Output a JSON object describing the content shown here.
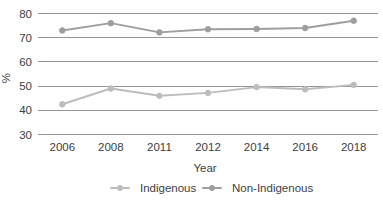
{
  "chart_data": {
    "type": "line",
    "title": "",
    "subtitle": "",
    "xlabel": "Year",
    "ylabel": "%",
    "categories": [
      "2006",
      "2008",
      "2011",
      "2012",
      "2014",
      "2016",
      "2018"
    ],
    "x": [
      2006,
      2008,
      2011,
      2012,
      2014,
      2016,
      2018
    ],
    "series": [
      {
        "name": "Indigenous",
        "color": "#bdbdbd",
        "marker": "circle",
        "values": [
          42.5,
          49.0,
          46.0,
          47.2,
          49.6,
          48.7,
          50.5
        ]
      },
      {
        "name": "Non-Indigenous",
        "color": "#9e9e9e",
        "marker": "circle",
        "values": [
          73.0,
          76.0,
          72.2,
          73.5,
          73.6,
          74.0,
          77.0
        ]
      }
    ],
    "ylim": [
      30,
      80
    ],
    "yticks": [
      30,
      40,
      50,
      60,
      70,
      80
    ],
    "ytick_labels": [
      "30",
      "40",
      "50",
      "60",
      "70",
      "80"
    ],
    "xtick_labels": [
      "2006",
      "2008",
      "2011",
      "2012",
      "2014",
      "2016",
      "2018"
    ],
    "grid": true,
    "grid_axis": "y",
    "legend_position": "bottom",
    "legend_entries": [
      "Indigenous",
      "Non-Indigenous"
    ]
  },
  "colors": {
    "indigenous": "#bdbdbd",
    "non_indigenous": "#9e9e9e",
    "gridline": "#8a8a8a",
    "text": "#404040",
    "background": "#ffffff"
  }
}
